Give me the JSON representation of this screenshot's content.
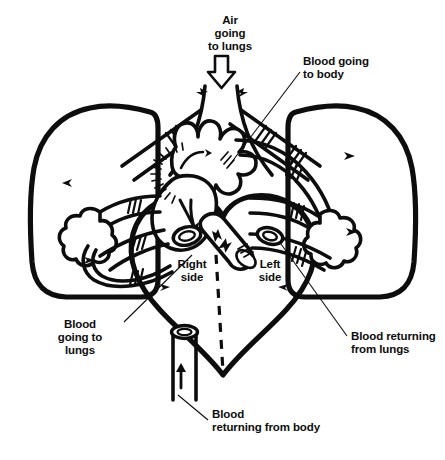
{
  "figure": {
    "background_color": "#ffffff",
    "ink_color": "#0d0d0d",
    "width": 445,
    "height": 460
  },
  "labels": {
    "air_to_lungs": {
      "name": "air-going-to-lungs",
      "lines": [
        "Air",
        "going",
        "to lungs"
      ],
      "align": "middle",
      "x": 230,
      "y": 24
    },
    "blood_to_body": {
      "name": "blood-going-to-body",
      "lines": [
        "Blood going",
        "to body"
      ],
      "align": "start",
      "x": 303,
      "y": 65
    },
    "right_side": {
      "name": "right-side",
      "lines": [
        "Right",
        "side"
      ],
      "align": "middle",
      "x": 192,
      "y": 268
    },
    "left_side": {
      "name": "left-side",
      "lines": [
        "Left",
        "side"
      ],
      "align": "middle",
      "x": 270,
      "y": 268
    },
    "blood_to_lungs": {
      "name": "blood-going-to-lungs",
      "lines": [
        "Blood",
        "going to",
        "lungs"
      ],
      "align": "middle",
      "x": 80,
      "y": 328
    },
    "blood_from_lungs": {
      "name": "blood-returning-from-lungs",
      "lines": [
        "Blood returning",
        "from lungs"
      ],
      "align": "start",
      "x": 351,
      "y": 340
    },
    "blood_from_body": {
      "name": "blood-returning-from-body",
      "lines": [
        "Blood",
        "returning from body"
      ],
      "align": "start",
      "x": 212,
      "y": 418
    }
  },
  "icons": {
    "air_inflow_arrow": "hollow-down-arrow",
    "vena_cava_arrow": "up-arrow",
    "flow_arrows": "small-solid-arrows"
  },
  "anatomy": {
    "parts": [
      "left-lung",
      "right-lung",
      "heart",
      "trachea",
      "bronchi",
      "aorta",
      "pulmonary-artery",
      "pulmonary-vein",
      "vena-cava"
    ],
    "divider": "dashed-midline"
  }
}
